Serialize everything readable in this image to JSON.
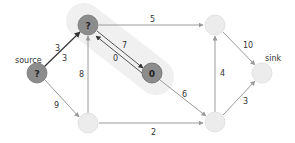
{
  "nodes": [
    {
      "id": "source",
      "label": "?",
      "caption": "source",
      "state": "visited"
    },
    {
      "id": "a",
      "label": "?",
      "caption": "",
      "state": "visited"
    },
    {
      "id": "b",
      "label": "0",
      "caption": "",
      "state": "visited"
    },
    {
      "id": "c",
      "label": "",
      "caption": "",
      "state": "unvisited"
    },
    {
      "id": "d",
      "label": "",
      "caption": "",
      "state": "unvisited"
    },
    {
      "id": "e",
      "label": "",
      "caption": "",
      "state": "unvisited"
    },
    {
      "id": "sink",
      "label": "",
      "caption": "sink",
      "state": "unvisited"
    }
  ],
  "edges": [
    {
      "from": "source",
      "to": "a",
      "labels": [
        "3",
        "3"
      ]
    },
    {
      "from": "source",
      "to": "c",
      "labels": [
        "9"
      ]
    },
    {
      "from": "c",
      "to": "a",
      "labels": [
        "8"
      ]
    },
    {
      "from": "a",
      "to": "d",
      "labels": [
        "5"
      ]
    },
    {
      "from": "a",
      "to": "b",
      "labels": [
        "7"
      ]
    },
    {
      "from": "b",
      "to": "a",
      "labels": [
        "0"
      ]
    },
    {
      "from": "b",
      "to": "e",
      "labels": [
        "6"
      ]
    },
    {
      "from": "c",
      "to": "e",
      "labels": [
        "2"
      ]
    },
    {
      "from": "e",
      "to": "d",
      "labels": [
        "4"
      ]
    },
    {
      "from": "d",
      "to": "sink",
      "labels": [
        "10"
      ]
    },
    {
      "from": "e",
      "to": "sink",
      "labels": [
        "3"
      ]
    }
  ],
  "colors": {
    "visited_fill": "#8c8c8c",
    "unvisited_fill": "#ececec",
    "highlight": "#f0f0f0",
    "edge": "#9a9a9a",
    "edge_active": "#333333"
  }
}
